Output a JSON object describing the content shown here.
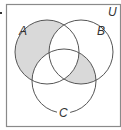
{
  "diagram": {
    "type": "venn",
    "universe_label": "U",
    "sets": [
      {
        "name": "A",
        "label": "A",
        "cx": 47,
        "cy": 52,
        "r": 32,
        "label_x": 19,
        "label_y": 35
      },
      {
        "name": "B",
        "label": "B",
        "cx": 81,
        "cy": 52,
        "r": 32,
        "label_x": 97,
        "label_y": 35
      },
      {
        "name": "C",
        "label": "C",
        "cx": 64,
        "cy": 81,
        "r": 32,
        "label_x": 59,
        "label_y": 117
      }
    ],
    "shaded_regions": [
      "A only (A ∩ B' ∩ C')",
      "B ∩ C ∩ A'"
    ],
    "colors": {
      "shade": "#d9d9d9",
      "stroke": "#555555",
      "frame": "#8a8a8a"
    }
  }
}
